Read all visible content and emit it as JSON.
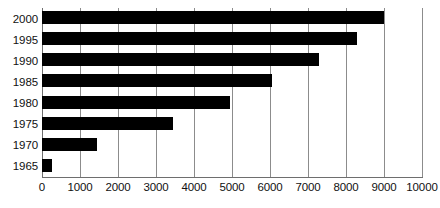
{
  "chart_data": {
    "type": "bar",
    "orientation": "horizontal",
    "title": "",
    "subtitle": "",
    "xlabel": "",
    "ylabel": "",
    "categories": [
      "2000",
      "1995",
      "1990",
      "1985",
      "1980",
      "1975",
      "1970",
      "1965"
    ],
    "values": [
      9000,
      8300,
      7300,
      6050,
      4950,
      3450,
      1450,
      260
    ],
    "series": [
      {
        "name": "",
        "values": [
          9000,
          8300,
          7300,
          6050,
          4950,
          3450,
          1450,
          260
        ]
      }
    ],
    "xlim": [
      0,
      10000
    ],
    "xticks": [
      0,
      1000,
      2000,
      3000,
      4000,
      5000,
      6000,
      7000,
      8000,
      9000,
      10000
    ],
    "xtick_labels": [
      "0",
      "1000",
      "2000",
      "3000",
      "4000",
      "5000",
      "6000",
      "7000",
      "8000",
      "9000",
      "10000"
    ],
    "grid": "vertical",
    "legend": null,
    "legend_position": "none",
    "annotations": [],
    "colors": {
      "bar": "#000000",
      "gridline": "#8c8c8c",
      "axis": "#6e6e6e",
      "background": "#ffffff",
      "text": "#111111"
    }
  }
}
